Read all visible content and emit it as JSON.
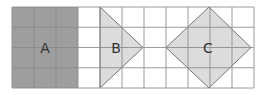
{
  "diagram": {
    "grid": {
      "left": 12,
      "top": 7,
      "cols": 11,
      "rows": 4,
      "cell_w": 22,
      "cell_h": 20.25,
      "line_color": "#8a8a8a"
    },
    "shapes": [
      {
        "id": "A",
        "label": "A",
        "type": "rectangle",
        "fill": "#9e9e9e",
        "label_pos": [
          45,
          53
        ]
      },
      {
        "id": "B",
        "label": "B",
        "type": "triangle",
        "fill": "#dcdcdc",
        "label_pos": [
          116,
          53
        ]
      },
      {
        "id": "C",
        "label": "C",
        "type": "square-rotated-45",
        "fill": "#dcdcdc",
        "label_pos": [
          208,
          53
        ]
      }
    ]
  }
}
